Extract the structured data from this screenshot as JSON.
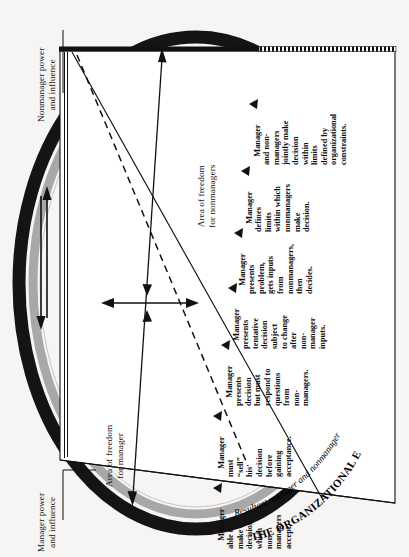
{
  "figure": {
    "title_curved": "THE ORGANIZATIONAL ENVIRONMENT",
    "resultant_curved": "Resultant manager and nonmanager behavior",
    "orientation": "rotated-90",
    "background_color": "#f6f5f3",
    "ink_color": "#111111",
    "ring_dark_color": "#141414",
    "ring_gray_color": "#a8a8a8"
  },
  "axes": {
    "nonmanager_power": "Nonmanager power\nand influence",
    "manager_power": "Manager power\nand influence",
    "area_freedom_manager": "Area of freedom\nfor manager",
    "area_freedom_nonmanagers": "Area of freedom\nfor nonmanagers"
  },
  "continuum": {
    "count": 7,
    "steps": [
      {
        "index": 1,
        "lines": [
          "Manager",
          "able to",
          "make",
          "decision",
          "which",
          "non-",
          "managers",
          "accept."
        ],
        "text": "Manager able to make decision which nonmanagers accept."
      },
      {
        "index": 2,
        "lines": [
          "Manager",
          "must",
          "“sell”",
          "his",
          "decision",
          "before",
          "gaining",
          "acceptance."
        ],
        "text": "Manager must “sell” his decision before gaining acceptance."
      },
      {
        "index": 3,
        "lines": [
          "Manager",
          "presents",
          "decision",
          "but must",
          "respond to",
          "questions",
          "from",
          "non-",
          "managers."
        ],
        "text": "Manager presents decision but must respond to questions from nonmanagers."
      },
      {
        "index": 4,
        "lines": [
          "Manager",
          "presents",
          "tentative",
          "decision",
          "subject",
          "to change",
          "after",
          "non-",
          "manager",
          "inputs."
        ],
        "text": "Manager presents tentative decision subject to change after nonmanager inputs."
      },
      {
        "index": 5,
        "lines": [
          "Manager",
          "presents",
          "problem,",
          "gets inputs",
          "from",
          "nonmanagers,",
          "then",
          "decides."
        ],
        "text": "Manager presents problem, gets inputs from nonmanagers, then decides."
      },
      {
        "index": 6,
        "lines": [
          "Manager",
          "defines",
          "limits",
          "within which",
          "nonmanagers",
          "make",
          "decision."
        ],
        "text": "Manager defines limits within which nonmanagers make decision."
      },
      {
        "index": 7,
        "lines": [
          "Manager",
          "and non-",
          "managers",
          "jointly make",
          "decision",
          "within",
          "limits",
          "defined by",
          "organizational",
          "constraints."
        ],
        "text": "Manager and nonmanagers jointly make decision within limits defined by organizational constraints."
      }
    ]
  },
  "markers": {
    "arrow_up": "↑",
    "arrow_down": "↓",
    "arrow_left": "←",
    "arrow_right": "→",
    "pointer": "▲"
  }
}
